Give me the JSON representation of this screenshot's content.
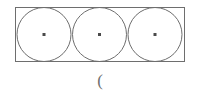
{
  "figure": {
    "background_color": "#ffffff",
    "stroke_color": "#6e6e6e",
    "dot_color": "#4a4a4a",
    "stroke_width": 1,
    "canvas": {
      "width": 200,
      "height": 100
    },
    "rectangle": {
      "name": "bounding-rectangle",
      "x": 15,
      "y": 7,
      "width": 170,
      "height": 55,
      "fill": "none"
    },
    "circles": [
      {
        "label": "circle-1",
        "cx": 44,
        "cy": 34.5,
        "r": 27.5
      },
      {
        "label": "circle-2",
        "cx": 99.5,
        "cy": 34.5,
        "r": 27.5
      },
      {
        "label": "circle-3",
        "cx": 155,
        "cy": 34.5,
        "r": 27.5
      }
    ],
    "center_dots": [
      {
        "label": "center-dot-1",
        "x": 44,
        "y": 34.5,
        "size": 3
      },
      {
        "label": "center-dot-2",
        "x": 99.5,
        "y": 34.5,
        "size": 3
      },
      {
        "label": "center-dot-3",
        "x": 155,
        "y": 34.5,
        "size": 3
      }
    ]
  },
  "caption": {
    "text": "("
  }
}
